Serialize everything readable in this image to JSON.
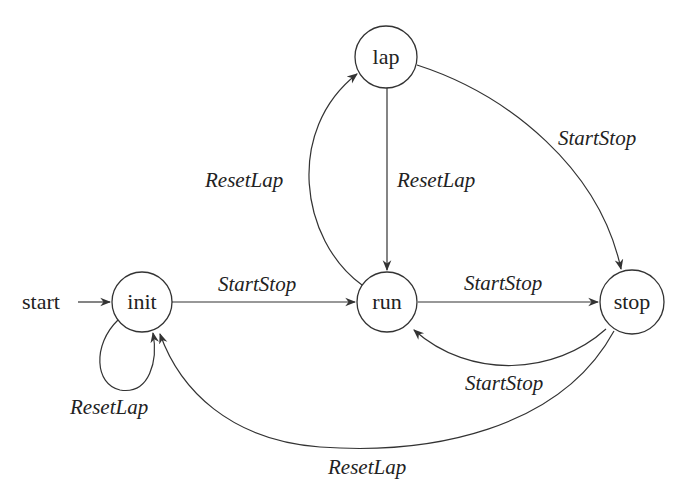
{
  "diagram": {
    "type": "state-machine",
    "start_label": "start",
    "states": [
      {
        "id": "init",
        "label": "init",
        "x": 142,
        "y": 302,
        "r": 30
      },
      {
        "id": "run",
        "label": "run",
        "x": 387,
        "y": 302,
        "r": 30
      },
      {
        "id": "lap",
        "label": "lap",
        "x": 385,
        "y": 57,
        "r": 31
      },
      {
        "id": "stop",
        "label": "stop",
        "x": 632,
        "y": 302,
        "r": 32
      }
    ],
    "transitions": [
      {
        "from": "init",
        "to": "init",
        "label": "ResetLap"
      },
      {
        "from": "init",
        "to": "run",
        "label": "StartStop"
      },
      {
        "from": "run",
        "to": "lap",
        "label": "ResetLap"
      },
      {
        "from": "lap",
        "to": "run",
        "label": "ResetLap"
      },
      {
        "from": "lap",
        "to": "stop",
        "label": "StartStop"
      },
      {
        "from": "run",
        "to": "stop",
        "label": "StartStop"
      },
      {
        "from": "stop",
        "to": "run",
        "label": "StartStop"
      },
      {
        "from": "stop",
        "to": "init",
        "label": "ResetLap"
      }
    ],
    "colors": {
      "stroke": "#333333",
      "text": "#222222",
      "background": "#ffffff"
    }
  }
}
